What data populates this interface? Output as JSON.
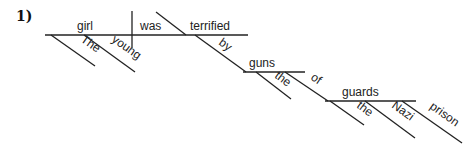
{
  "problem_number": "1)",
  "sentence": "The young girl was terrified by guns of the Nazi prison guards",
  "words": {
    "subject": "girl",
    "verb": "was",
    "predicate_adjective": "terrified",
    "subject_modifier_1": "The",
    "subject_modifier_2": "young",
    "preposition_1": "by",
    "object_1": "guns",
    "object_1_modifier": "the",
    "preposition_2": "of",
    "object_2": "guards",
    "object_2_modifier_1": "the",
    "object_2_modifier_2": "Nazi",
    "object_2_modifier_3": "prison"
  }
}
